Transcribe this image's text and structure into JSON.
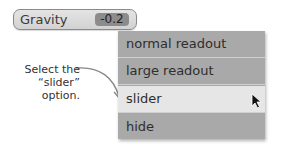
{
  "control": {
    "label": "Gravity",
    "value": "-0.2"
  },
  "menu": {
    "items": [
      {
        "label": "normal readout"
      },
      {
        "label": "large readout"
      },
      {
        "label": "slider",
        "selected": true
      },
      {
        "label": "hide"
      }
    ]
  },
  "annotation": {
    "line1": "Select the",
    "line2": "“slider”",
    "line3": "option."
  }
}
